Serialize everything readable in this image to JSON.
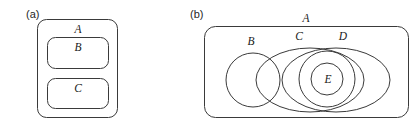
{
  "figure": {
    "background_color": "#ffffff",
    "stroke_color": "#3a3a3a",
    "label_color": "#1a1a1a",
    "panels": [
      {
        "key": "a",
        "label": "(a)",
        "label_x": 26,
        "label_y": 18,
        "shapes": [
          {
            "name": "set-a-rect",
            "set": "A",
            "type": "rounded-rect",
            "x": 37.5,
            "y": 19.5,
            "width": 80,
            "height": 98,
            "radius": 9
          },
          {
            "name": "set-b-rect",
            "set": "B",
            "type": "rounded-rect",
            "x": 47.5,
            "y": 37.5,
            "width": 61,
            "height": 31,
            "radius": 8
          },
          {
            "name": "set-c-rect",
            "set": "C",
            "type": "rounded-rect",
            "x": 47.5,
            "y": 78.5,
            "width": 61,
            "height": 30,
            "radius": 8
          }
        ],
        "labels": [
          {
            "name": "set-label-a",
            "text": "A",
            "x": 78,
            "y": 33
          },
          {
            "name": "set-label-b",
            "text": "B",
            "x": 78,
            "y": 51
          },
          {
            "name": "set-label-c",
            "text": "C",
            "x": 78,
            "y": 92
          }
        ]
      },
      {
        "key": "b",
        "label": "(b)",
        "label_x": 190,
        "label_y": 18,
        "shapes": [
          {
            "name": "set-a-rect",
            "set": "A",
            "type": "rounded-rect",
            "x": 204.5,
            "y": 26.5,
            "width": 204,
            "height": 91,
            "radius": 11
          },
          {
            "name": "set-b-circle",
            "set": "B",
            "type": "circle",
            "cx": 253,
            "cy": 80,
            "r": 27
          },
          {
            "name": "set-c-ellipse",
            "set": "C",
            "type": "ellipse",
            "cx": 310,
            "cy": 80,
            "rx": 54,
            "ry": 32
          },
          {
            "name": "set-d-ellipse",
            "set": "D",
            "type": "ellipse",
            "cx": 336,
            "cy": 80,
            "rx": 54,
            "ry": 32
          },
          {
            "name": "set-e-circle",
            "set": "E",
            "type": "circle",
            "cx": 327,
            "cy": 79,
            "r": 16
          },
          {
            "name": "set-e-outer-circle",
            "set": "E",
            "type": "circle",
            "cx": 327,
            "cy": 79,
            "r": 28
          }
        ],
        "labels": [
          {
            "name": "set-label-a",
            "text": "A",
            "x": 306,
            "y": 22
          },
          {
            "name": "set-label-b",
            "text": "B",
            "x": 251,
            "y": 45
          },
          {
            "name": "set-label-c",
            "text": "C",
            "x": 299,
            "y": 40
          },
          {
            "name": "set-label-d",
            "text": "D",
            "x": 343,
            "y": 40
          },
          {
            "name": "set-label-e",
            "text": "E",
            "x": 328,
            "y": 83
          }
        ]
      }
    ]
  }
}
